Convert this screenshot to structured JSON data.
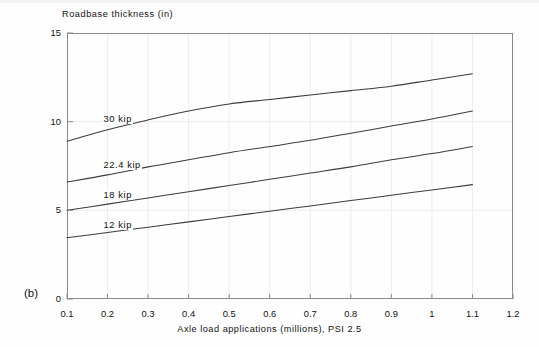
{
  "figure": {
    "panel_label": "(b)",
    "background_color": "#fefefe",
    "line_color": "#3c3c3c",
    "axis_color": "#8a8a8a",
    "grid_color": "#ededed",
    "text_color": "#111111"
  },
  "chart_data": {
    "type": "line",
    "title": "",
    "subtitle": "",
    "xlabel": "Axle load applications (millions), PSI 2.5",
    "ylabel": "Roadbase thickness (in)",
    "xlim": [
      0.1,
      1.2
    ],
    "ylim": [
      0,
      15
    ],
    "xticks": [
      0.1,
      0.2,
      0.3,
      0.4,
      0.5,
      0.6,
      0.7,
      0.8,
      0.9,
      1,
      1.1,
      1.2
    ],
    "xticklabels": [
      "0.1",
      "0.2",
      "0.3",
      "0.4",
      "0.5",
      "0.6",
      "0.7",
      "0.8",
      "0.9",
      "1",
      "1.1",
      "1.2"
    ],
    "yticks": [
      0,
      5,
      10,
      15
    ],
    "yticklabels": [
      "0",
      "5",
      "10",
      "15"
    ],
    "grid": "faint vertical gridlines at each x tick; faint horizontal gridlines at y=5 and y=10",
    "legend": "inline curve labels placed to the left of each line",
    "x": [
      0.1,
      0.2,
      0.3,
      0.4,
      0.5,
      0.6,
      0.7,
      0.8,
      0.9,
      1.0,
      1.1
    ],
    "series": [
      {
        "name": "30 kip",
        "label": "30 kip",
        "label_x": 0.2,
        "label_y": 10.1,
        "values": [
          8.9,
          9.55,
          10.1,
          10.6,
          11.0,
          11.25,
          11.5,
          11.75,
          12.0,
          12.35,
          12.7
        ]
      },
      {
        "name": "22.4 kip",
        "label": "22.4 kip",
        "label_x": 0.2,
        "label_y": 7.5,
        "values": [
          6.6,
          7.0,
          7.45,
          7.85,
          8.25,
          8.6,
          8.95,
          9.35,
          9.75,
          10.15,
          10.6
        ]
      },
      {
        "name": "18 kip",
        "label": "18 kip",
        "label_x": 0.2,
        "label_y": 5.8,
        "values": [
          5.0,
          5.35,
          5.7,
          6.05,
          6.4,
          6.75,
          7.1,
          7.45,
          7.85,
          8.2,
          8.6
        ]
      },
      {
        "name": "12 kip",
        "label": "12 kip",
        "label_x": 0.2,
        "label_y": 4.1,
        "values": [
          3.45,
          3.75,
          4.05,
          4.35,
          4.65,
          4.95,
          5.25,
          5.55,
          5.85,
          6.15,
          6.45
        ]
      }
    ]
  }
}
